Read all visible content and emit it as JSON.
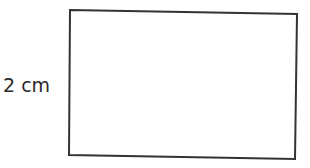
{
  "figure": {
    "shape": "rectangle",
    "side_label": "2 cm",
    "side_label_position": "left",
    "stroke_color": "#333333",
    "fill_color": "#ffffff"
  }
}
